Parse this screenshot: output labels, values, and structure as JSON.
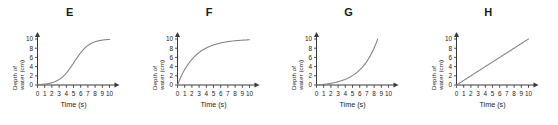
{
  "figure": {
    "background_color": "#ffffff",
    "curve_color": "#808080",
    "axis_color": "#3a3a3a",
    "text_color": "#222222"
  },
  "axes": {
    "xlabel": "Time (s)",
    "ylabel_line1": "Depth of",
    "ylabel_line2": "water (cm)",
    "xticks": [
      "0",
      "1",
      "2",
      "3",
      "4",
      "5",
      "6",
      "7",
      "8",
      "9",
      "10"
    ],
    "yticks": [
      "0",
      "2",
      "4",
      "6",
      "8",
      "10"
    ],
    "xlim": [
      0,
      10
    ],
    "ylim": [
      0,
      10
    ]
  },
  "panels": [
    {
      "letter": "E",
      "shape": "sigmoid"
    },
    {
      "letter": "F",
      "shape": "logarithmic"
    },
    {
      "letter": "G",
      "shape": "exponential"
    },
    {
      "letter": "H",
      "shape": "linear"
    }
  ],
  "chart_data": [
    {
      "type": "line",
      "title": "E",
      "xlabel": "Time (s)",
      "ylabel": "Depth of water (cm)",
      "xlim": [
        0,
        10
      ],
      "ylim": [
        0,
        10
      ],
      "grid": false,
      "legend": "none",
      "shape": "sigmoid",
      "x": [
        0,
        1,
        2,
        3,
        4,
        5,
        6,
        7,
        8,
        9,
        10
      ],
      "y": [
        0.1,
        0.3,
        0.7,
        1.5,
        3.2,
        5.6,
        7.7,
        9.0,
        9.7,
        9.9,
        10.0
      ]
    },
    {
      "type": "line",
      "title": "F",
      "xlabel": "Time (s)",
      "ylabel": "Depth of water (cm)",
      "xlim": [
        0,
        10
      ],
      "ylim": [
        0,
        10
      ],
      "grid": false,
      "legend": "none",
      "shape": "logarithmic",
      "x": [
        0,
        1,
        2,
        3,
        4,
        5,
        6,
        7,
        8,
        9,
        10
      ],
      "y": [
        0.0,
        3.6,
        5.8,
        7.2,
        8.2,
        8.8,
        9.2,
        9.5,
        9.7,
        9.9,
        10.0
      ]
    },
    {
      "type": "line",
      "title": "G",
      "xlabel": "Time (s)",
      "ylabel": "Depth of water (cm)",
      "xlim": [
        0,
        10
      ],
      "ylim": [
        0,
        10
      ],
      "grid": false,
      "legend": "none",
      "shape": "exponential",
      "x": [
        0,
        1,
        2,
        3,
        4,
        5,
        6,
        7,
        7.5,
        8,
        8.3,
        8.5
      ],
      "y": [
        0.0,
        0.5,
        1.0,
        1.6,
        2.2,
        2.8,
        3.7,
        5.0,
        5.9,
        7.2,
        8.5,
        10.0
      ]
    },
    {
      "type": "line",
      "title": "H",
      "xlabel": "Time (s)",
      "ylabel": "Depth of water (cm)",
      "xlim": [
        0,
        10
      ],
      "ylim": [
        0,
        10
      ],
      "grid": false,
      "legend": "none",
      "shape": "linear",
      "x": [
        0,
        1,
        2,
        3,
        4,
        5,
        6,
        7,
        8,
        9,
        10
      ],
      "y": [
        0,
        1,
        2,
        3,
        4,
        5,
        6,
        7,
        8,
        9,
        10
      ]
    }
  ]
}
